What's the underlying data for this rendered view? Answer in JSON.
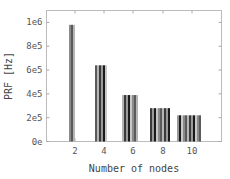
{
  "chart_data": {
    "type": "bar",
    "title": "",
    "xlabel": "Number of nodes",
    "ylabel": "PRF [Hz]",
    "categories": [
      "2",
      "4",
      "6",
      "8",
      "10"
    ],
    "series_per_category": [
      1,
      2,
      3,
      4,
      5
    ],
    "values": [
      980000,
      640000,
      390000,
      280000,
      220000
    ],
    "ylim": [
      0,
      1100000
    ],
    "yticks": [
      0,
      200000,
      400000,
      600000,
      800000,
      1000000
    ],
    "ytick_labels": [
      "0e",
      "2e5",
      "4e5",
      "6e5",
      "8e5",
      "1e6"
    ],
    "xticks": [
      "2",
      "4",
      "6",
      "8",
      "10"
    ],
    "grid": false,
    "legend": null,
    "stripe_colors": [
      "#8a8a8a",
      "#5a5a5a",
      "#b5b5b5",
      "#3a3a3a",
      "#9a9a9a",
      "#1a1a1a",
      "#c8c8c8"
    ]
  },
  "labels": {
    "xlabel": "Number of nodes",
    "ylabel": "PRF [Hz]"
  }
}
